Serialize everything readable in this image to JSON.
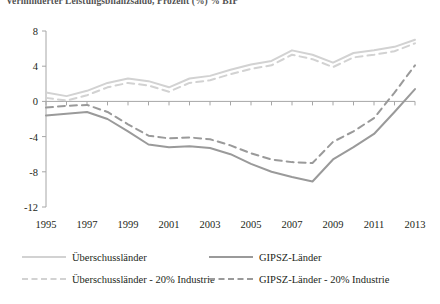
{
  "chart_data": {
    "type": "line",
    "title": "Verminderter Leistungsbilanzsaldo, Prozent (%) % BIP",
    "xlabel": "",
    "ylabel": "",
    "ylim": [
      -12,
      8
    ],
    "xlim": [
      1995,
      2013
    ],
    "grid": false,
    "legend_position": "bottom",
    "ytick_labels": [
      "8",
      "4",
      "0",
      "-4",
      "-8",
      "-12"
    ],
    "ytick_values": [
      8,
      4,
      0,
      -4,
      -8,
      -12
    ],
    "xtick_labels": [
      "1995",
      "1997",
      "1999",
      "2001",
      "2003",
      "2005",
      "2007",
      "2009",
      "2011",
      "2013"
    ],
    "xtick_values": [
      1995,
      1997,
      1999,
      2001,
      2003,
      2005,
      2007,
      2009,
      2011,
      2013
    ],
    "x": [
      1995,
      1996,
      1997,
      1998,
      1999,
      2000,
      2001,
      2002,
      2003,
      2004,
      2005,
      2006,
      2007,
      2008,
      2009,
      2010,
      2011,
      2012,
      2013
    ],
    "series": [
      {
        "name": "Überschussländer",
        "style": "solid",
        "color": "#d2d2d2",
        "values": [
          1.0,
          0.6,
          1.2,
          2.1,
          2.6,
          2.3,
          1.6,
          2.6,
          2.9,
          3.6,
          4.2,
          4.6,
          5.8,
          5.3,
          4.4,
          5.5,
          5.8,
          6.2,
          7.0
        ]
      },
      {
        "name": "GIPSZ-Länder",
        "style": "solid",
        "color": "#9a9a9a",
        "values": [
          -1.6,
          -1.4,
          -1.2,
          -2.0,
          -3.4,
          -4.9,
          -5.2,
          -5.1,
          -5.3,
          -6.0,
          -7.1,
          -8.0,
          -8.6,
          -9.1,
          -6.6,
          -5.2,
          -3.7,
          -1.2,
          1.4
        ]
      },
      {
        "name": "Überschussländer - 20% Industrie",
        "style": "dashed",
        "color": "#d2d2d2",
        "values": [
          0.4,
          0.1,
          0.7,
          1.6,
          2.1,
          1.8,
          1.1,
          2.1,
          2.4,
          3.1,
          3.7,
          4.1,
          5.3,
          4.8,
          3.9,
          5.0,
          5.3,
          5.7,
          6.6
        ]
      },
      {
        "name": "GIPSZ-Länder - 20% Industrie",
        "style": "dashed",
        "color": "#9a9a9a",
        "values": [
          -0.7,
          -0.5,
          -0.4,
          -1.2,
          -2.6,
          -3.9,
          -4.2,
          -4.1,
          -4.3,
          -5.0,
          -5.9,
          -6.6,
          -6.9,
          -7.0,
          -4.6,
          -3.4,
          -1.9,
          1.0,
          4.1
        ]
      }
    ]
  },
  "legend": {
    "items": [
      {
        "label": "Überschussländer",
        "style": "solid",
        "color": "#d2d2d2"
      },
      {
        "label": "GIPSZ-Länder",
        "style": "solid",
        "color": "#9a9a9a"
      },
      {
        "label": "Überschussländer - 20% Industrie",
        "style": "dashed",
        "color": "#d2d2d2"
      },
      {
        "label": "GIPSZ-Länder - 20% Industrie",
        "style": "dashed",
        "color": "#9a9a9a"
      }
    ]
  },
  "axis": {
    "line_color": "#a6a6a6"
  }
}
